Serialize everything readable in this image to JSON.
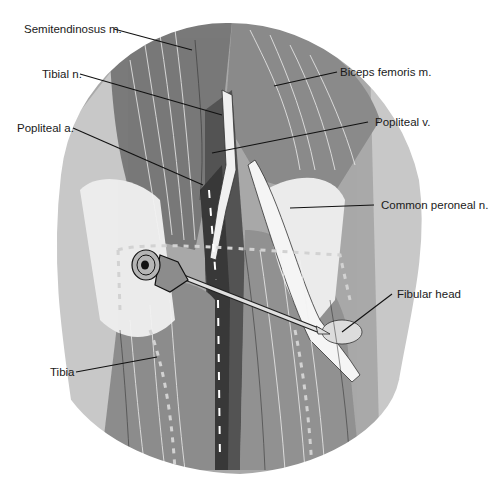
{
  "figure": {
    "colors": {
      "muscle_dark": "#6e6e6e",
      "muscle_mid": "#8a8a8a",
      "muscle_light": "#a9a9a9",
      "fascia": "#c8c8c8",
      "tendon": "#e8e8e8",
      "vessel": "#3a3a3a",
      "outline": "#1e1e1e"
    },
    "labels": [
      {
        "id": "semitendinosus",
        "text": "Semitendinosus m."
      },
      {
        "id": "tibial-nerve",
        "text": "Tibial n."
      },
      {
        "id": "popliteal-artery",
        "text": "Popliteal a."
      },
      {
        "id": "biceps-femoris",
        "text": "Biceps femoris m."
      },
      {
        "id": "popliteal-vein",
        "text": "Popliteal v."
      },
      {
        "id": "common-peroneal-nerve",
        "text": "Common peroneal n."
      },
      {
        "id": "fibular-head",
        "text": "Fibular head"
      },
      {
        "id": "tibia",
        "text": "Tibia"
      }
    ]
  }
}
